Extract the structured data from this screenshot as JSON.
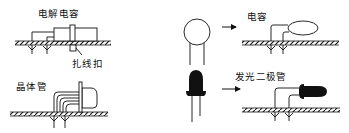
{
  "diagram": {
    "type": "component mounting illustration",
    "panels": [
      {
        "id": "electrolytic-capacitor",
        "label": "电解电容",
        "callout": "扎线扣",
        "description": "Electrolytic capacitor laid flat on PCB, leads bent through board, secured with cable tie"
      },
      {
        "id": "transistor",
        "label": "晶体管",
        "description": "Transistor bent horizontally, leads bent down through PCB"
      },
      {
        "id": "ceramic-capacitor",
        "label": "电容",
        "description": "Disc capacitor shown upright, arrow to lying-down mounting on PCB"
      },
      {
        "id": "led",
        "label": "发光二极管",
        "description": "LED shown upright, arrow to lying-down mounting on PCB"
      }
    ]
  },
  "colors": {
    "ink": "#111111",
    "background": "#ffffff"
  }
}
